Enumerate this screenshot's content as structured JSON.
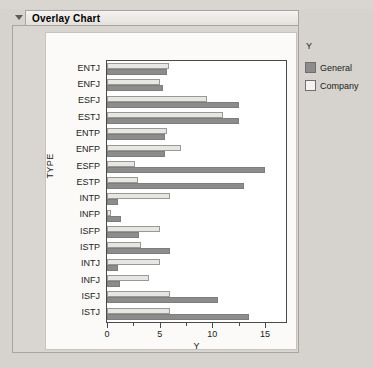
{
  "panel": {
    "title": "Overlay Chart",
    "disclosure_icon": "triangle-down-icon",
    "expanded": true
  },
  "legend": {
    "title": "Y",
    "items": [
      {
        "label": "General",
        "color": "#8c8c8c",
        "swatch_icon": "legend-swatch-filled"
      },
      {
        "label": "Company",
        "color": "#f3f2f0",
        "swatch_icon": "legend-swatch-outline"
      }
    ]
  },
  "axes": {
    "x_title": "Y",
    "y_title": "TYPE",
    "x_ticks": [
      {
        "value": 0,
        "label": "0",
        "major": true
      },
      {
        "value": 2.5,
        "label": "",
        "major": false
      },
      {
        "value": 5,
        "label": "5",
        "major": true
      },
      {
        "value": 7.5,
        "label": "",
        "major": false
      },
      {
        "value": 10,
        "label": "10",
        "major": true
      },
      {
        "value": 12.5,
        "label": "",
        "major": false
      },
      {
        "value": 15,
        "label": "15",
        "major": true
      }
    ]
  },
  "chart_data": {
    "type": "bar",
    "orientation": "horizontal",
    "title": "Overlay Chart",
    "xlabel": "Y",
    "ylabel": "TYPE",
    "xlim": [
      0,
      17
    ],
    "grid": false,
    "legend_position": "right",
    "legend_title": "Y",
    "categories": [
      "ENTJ",
      "ENFJ",
      "ESFJ",
      "ESTJ",
      "ENTP",
      "ENFP",
      "ESFP",
      "ESTP",
      "INTP",
      "INFP",
      "ISFP",
      "ISTP",
      "INTJ",
      "INFJ",
      "ISFJ",
      "ISTJ"
    ],
    "series": [
      {
        "name": "Company",
        "color": "#e8e6e2",
        "values": [
          5.9,
          5.0,
          9.5,
          11.0,
          5.7,
          7.0,
          2.7,
          2.9,
          6.0,
          0.4,
          5.0,
          3.2,
          5.0,
          4.0,
          6.0,
          6.0
        ]
      },
      {
        "name": "General",
        "color": "#8c8c8c",
        "values": [
          5.7,
          5.3,
          12.5,
          12.5,
          5.5,
          5.5,
          15.0,
          13.0,
          1.0,
          1.3,
          3.0,
          6.0,
          1.0,
          1.2,
          10.5,
          13.5
        ]
      }
    ]
  }
}
